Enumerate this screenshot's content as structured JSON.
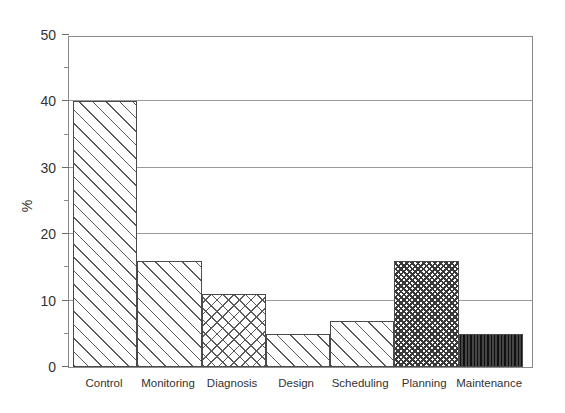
{
  "chart_data": {
    "type": "bar",
    "title": "",
    "subtitle": "",
    "xlabel": "",
    "ylabel": "%",
    "categories": [
      "Control",
      "Monitoring",
      "Diagnosis",
      "Design",
      "Scheduling",
      "Planning",
      "Maintenance"
    ],
    "values": [
      40,
      16,
      11,
      5,
      7,
      16,
      5
    ],
    "series": [
      {
        "name": "Percentage",
        "values": [
          40,
          16,
          11,
          5,
          7,
          16,
          5
        ]
      }
    ],
    "ylim": [
      0,
      50
    ],
    "xlim_note": "categorical, 7 contiguous bars, no gaps",
    "y_major_ticks": [
      0,
      10,
      20,
      30,
      40,
      50
    ],
    "y_minor_ticks": [
      5,
      15,
      25,
      35,
      45
    ],
    "y_tick_labels": [
      "0",
      "10",
      "20",
      "30",
      "40",
      "50"
    ],
    "gridlines": {
      "horizontal": true,
      "vertical": false,
      "at": [
        10,
        20,
        30,
        40
      ],
      "color": "#9a9a9a"
    },
    "legend": {
      "visible": false,
      "position": "none"
    },
    "annotations": [],
    "bar_fills": [
      {
        "category": "Control",
        "pattern": "diagonal-hatch",
        "pattern_class": "pat-diag"
      },
      {
        "category": "Monitoring",
        "pattern": "diagonal-hatch",
        "pattern_class": "pat-diag"
      },
      {
        "category": "Diagnosis",
        "pattern": "cross-hatch",
        "pattern_class": "pat-cross"
      },
      {
        "category": "Design",
        "pattern": "diagonal-hatch",
        "pattern_class": "pat-diag"
      },
      {
        "category": "Scheduling",
        "pattern": "diagonal-hatch",
        "pattern_class": "pat-diag"
      },
      {
        "category": "Planning",
        "pattern": "dense-cross-hatch",
        "pattern_class": "pat-crossdense"
      },
      {
        "category": "Maintenance",
        "pattern": "dense-vertical-lines",
        "pattern_class": "pat-vert"
      }
    ],
    "colors": {
      "frame": "#8a8a8a",
      "grid": "#9a9a9a",
      "bar_outline": "#4a4a4a",
      "hatch": "#5b5b5b",
      "background": "#ffffff",
      "text": "#333333"
    }
  }
}
